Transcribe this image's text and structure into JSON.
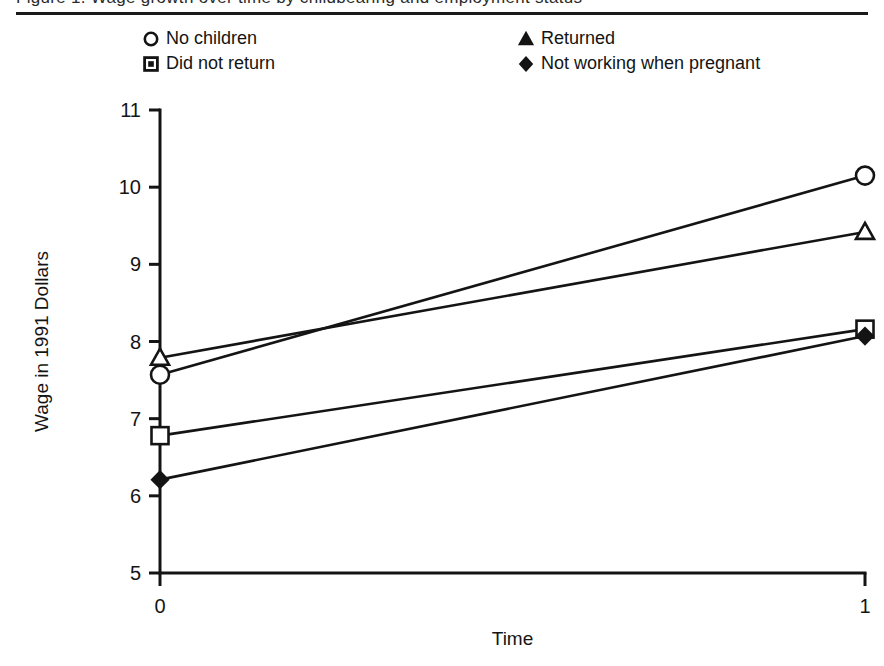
{
  "figure": {
    "clipped_caption_text": "Figure 1. Wage growth over time by childbearing and employment status",
    "top_rule": true
  },
  "legend": {
    "columns": [
      {
        "entries": [
          {
            "marker": "circle-marker-icon",
            "label": "No children"
          },
          {
            "marker": "square-marker-icon",
            "label": "Did not return"
          }
        ]
      },
      {
        "entries": [
          {
            "marker": "triangle-marker-icon",
            "label": "Returned"
          },
          {
            "marker": "diamond-marker-icon",
            "label": "Not working when pregnant"
          }
        ]
      }
    ]
  },
  "chart_data": {
    "type": "line",
    "title": "",
    "xlabel": "Time",
    "ylabel": "Wage in 1991 Dollars",
    "x": [
      0,
      1
    ],
    "x_ticklabels": [
      "0",
      "1"
    ],
    "xlim": [
      0,
      1
    ],
    "ylim": [
      5,
      11
    ],
    "y_ticks": [
      5,
      6,
      7,
      8,
      9,
      10,
      11
    ],
    "y_ticklabels": [
      "5",
      "6",
      "7",
      "8",
      "9",
      "10",
      "11"
    ],
    "grid": false,
    "legend_position": "above-plot",
    "series": [
      {
        "name": "No children",
        "marker": "circle",
        "values": [
          7.57,
          10.15
        ]
      },
      {
        "name": "Returned",
        "marker": "triangle",
        "values": [
          7.79,
          9.42
        ]
      },
      {
        "name": "Did not return",
        "marker": "square",
        "values": [
          6.78,
          8.16
        ]
      },
      {
        "name": "Not working when pregnant",
        "marker": "diamond",
        "values": [
          6.21,
          8.07
        ]
      }
    ]
  }
}
